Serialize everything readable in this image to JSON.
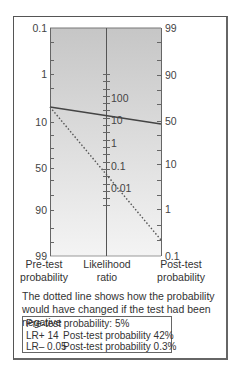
{
  "chart_data": {
    "type": "nomogram",
    "axes": [
      {
        "name": "Pre-test probability",
        "ticks": [
          "0.1",
          "1",
          "10",
          "50",
          "90",
          "99"
        ]
      },
      {
        "name": "Likelihood ratio",
        "ticks": [
          "100",
          "10",
          "1",
          "0.1",
          "0.01"
        ]
      },
      {
        "name": "Post-test probability",
        "ticks": [
          "99",
          "90",
          "50",
          "10",
          "1",
          "0.1"
        ]
      }
    ],
    "lines": [
      {
        "style": "solid",
        "pretest": 5,
        "lr": 14,
        "posttest": 42
      },
      {
        "style": "dotted",
        "pretest": 5,
        "lr": 0.05,
        "posttest": 0.3
      }
    ]
  },
  "left_axis": {
    "ticks": [
      {
        "label": "0.1",
        "y": 28
      },
      {
        "label": "1",
        "y": 74
      },
      {
        "label": "10",
        "y": 122
      },
      {
        "label": "50",
        "y": 168
      },
      {
        "label": "90",
        "y": 210
      },
      {
        "label": "99",
        "y": 256
      }
    ],
    "title_line1": "Pre-test",
    "title_line2": "probability"
  },
  "middle_axis": {
    "ticks": [
      {
        "label": "100",
        "y": 98
      },
      {
        "label": "10",
        "y": 120
      },
      {
        "label": "1",
        "y": 143
      },
      {
        "label": "0.1",
        "y": 166
      },
      {
        "label": "0.01",
        "y": 188
      }
    ],
    "title_line1": "Likelihood",
    "title_line2": "ratio"
  },
  "right_axis": {
    "ticks": [
      {
        "label": "99",
        "y": 28
      },
      {
        "label": "90",
        "y": 75
      },
      {
        "label": "50",
        "y": 121
      },
      {
        "label": "10",
        "y": 164
      },
      {
        "label": "1",
        "y": 209
      },
      {
        "label": "0.1",
        "y": 256
      }
    ],
    "title_line1": "Post-test",
    "title_line2": "probability"
  },
  "note": "The dotted line shows how the probability would have changed if the test had been negative",
  "summary": {
    "pretest": "Pre-test probability: 5%",
    "rows": [
      {
        "lr": "LR+  14",
        "post": "Post-test probability  42%"
      },
      {
        "lr": "LR–  0.05",
        "post": "Post-test probability  0.3%"
      }
    ]
  },
  "colors": {
    "panel_top": "#c9c9c9",
    "panel_bottom": "#f2f2f2",
    "axis": "#666666",
    "solid_line": "#444444",
    "dotted_line": "#555555"
  }
}
